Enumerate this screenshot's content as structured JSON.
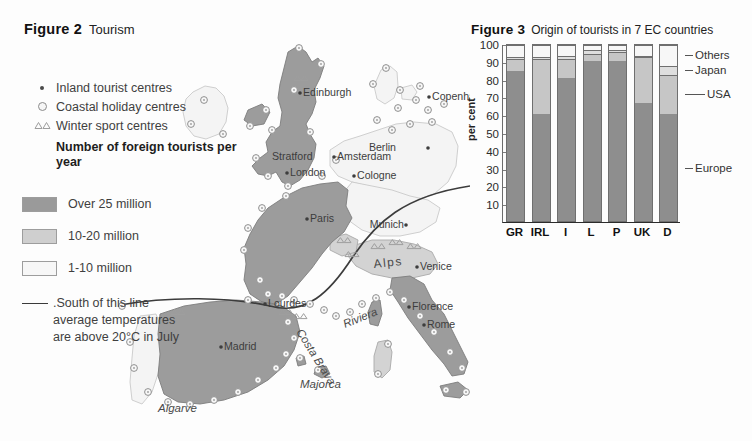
{
  "figure2": {
    "number": "Figure 2",
    "title": "Tourism",
    "symbol_legend": [
      {
        "icon": "inland-dot-icon",
        "label": "Inland tourist centres"
      },
      {
        "icon": "coastal-circle-icon",
        "label": "Coastal holiday centres"
      },
      {
        "icon": "winter-triangle-icon",
        "label": "Winter sport centres"
      }
    ],
    "class_legend_title": "Number of foreign tourists per year",
    "class_legend": [
      {
        "label": "Over 25 million",
        "color": "#9a9a9a"
      },
      {
        "label": "10-20 million",
        "color": "#cfcfcf"
      },
      {
        "label": "1-10 million",
        "color": "#f4f4f4"
      }
    ],
    "line_legend": ".South of this line average temperatures are above 20°C in July",
    "line_legend_lines": [
      ".South of this line",
      "average temperatures",
      "are above 20°C in July"
    ],
    "city_labels": [
      {
        "name": "Edinburgh",
        "x": 303,
        "y": 96,
        "anchor": "start",
        "dot": "left"
      },
      {
        "name": "Copenhagen",
        "x": 432,
        "y": 100,
        "anchor": "start",
        "dot": "left"
      },
      {
        "name": "Stratford",
        "x": 272,
        "y": 156,
        "anchor": "start",
        "dot": "none"
      },
      {
        "name": "Amsterdam",
        "x": 337,
        "y": 160,
        "anchor": "start",
        "dot": "left"
      },
      {
        "name": "Berlin",
        "x": 398,
        "y": 151,
        "anchor": "start",
        "dot": "right"
      },
      {
        "name": "London",
        "x": 290,
        "y": 176,
        "anchor": "start",
        "dot": "left"
      },
      {
        "name": "Cologne",
        "x": 357,
        "y": 179,
        "anchor": "start",
        "dot": "left"
      },
      {
        "name": "Paris",
        "x": 310,
        "y": 222,
        "anchor": "start",
        "dot": "left"
      },
      {
        "name": "Munich",
        "x": 376,
        "y": 228,
        "anchor": "start",
        "dot": "right"
      },
      {
        "name": "Venice",
        "x": 420,
        "y": 270,
        "anchor": "start",
        "dot": "left"
      },
      {
        "name": "Lourdes",
        "x": 268,
        "y": 307,
        "anchor": "start",
        "dot": "left"
      },
      {
        "name": "Florence",
        "x": 412,
        "y": 310,
        "anchor": "start",
        "dot": "left"
      },
      {
        "name": "Rome",
        "x": 427,
        "y": 328,
        "anchor": "start",
        "dot": "left"
      },
      {
        "name": "Madrid",
        "x": 224,
        "y": 350,
        "anchor": "start",
        "dot": "left"
      },
      {
        "name": "Athens",
        "x": 585,
        "y": 368,
        "anchor": "start",
        "dot": "left"
      }
    ],
    "region_labels": [
      {
        "name": "Alps",
        "x": 374,
        "y": 268,
        "rotate": -8,
        "style": "alps"
      },
      {
        "name": "Riviera",
        "x": 345,
        "y": 325,
        "rotate": -22,
        "style": "italic"
      },
      {
        "name": "Costa Brava",
        "x": 298,
        "y": 330,
        "rotate": 60,
        "style": "italic"
      },
      {
        "name": "Majorca",
        "x": 303,
        "y": 385,
        "rotate": 0,
        "style": "italic"
      },
      {
        "name": "Algarve",
        "x": 160,
        "y": 410,
        "rotate": 0,
        "style": "italic"
      },
      {
        "name": "Greek Islands",
        "x": 586,
        "y": 392,
        "rotate": 0,
        "style": "italic"
      }
    ]
  },
  "figure3": {
    "number": "Figure 3",
    "title": "Origin of tourists in  7 EC countries",
    "ylabel": "per cent",
    "yticks": [
      10,
      20,
      30,
      40,
      50,
      60,
      70,
      80,
      90,
      100
    ],
    "right_legend": [
      "Others",
      "Japan",
      "USA",
      "Europe"
    ],
    "colors": {
      "Europe": "#8e8e8e",
      "USA": "#c6c6c6",
      "Japan": "#dedede",
      "Others": "#f7f7f7"
    },
    "chart_data": {
      "type": "bar",
      "subtype": "stacked-bar-100",
      "title": "Origin of tourists in  7 EC countries",
      "xlabel": "",
      "ylabel": "per cent",
      "ylim": [
        0,
        100
      ],
      "yticks": [
        10,
        20,
        30,
        40,
        50,
        60,
        70,
        80,
        90,
        100
      ],
      "grid": false,
      "legend_position": "right",
      "categories": [
        "GR",
        "IRL",
        "I",
        "L",
        "P",
        "UK",
        "D"
      ],
      "series": [
        {
          "name": "Europe",
          "values": [
            85,
            61,
            81,
            91,
            91,
            67,
            61
          ]
        },
        {
          "name": "USA",
          "values": [
            7,
            31,
            11,
            4,
            5,
            26,
            22
          ]
        },
        {
          "name": "Japan",
          "values": [
            1,
            1,
            2,
            2,
            1,
            1,
            5
          ]
        },
        {
          "name": "Others",
          "values": [
            7,
            7,
            6,
            3,
            3,
            6,
            12
          ]
        }
      ]
    }
  }
}
